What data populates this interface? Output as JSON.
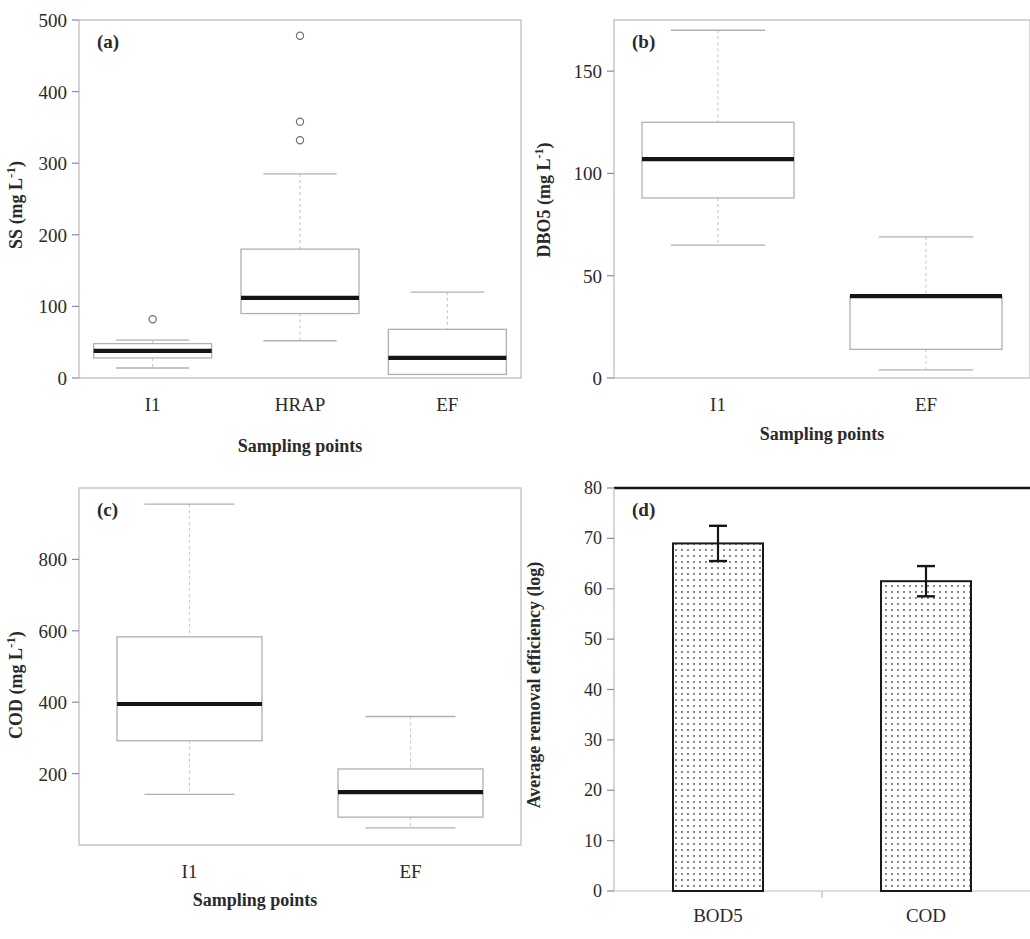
{
  "figure": {
    "panels": [
      "a",
      "b",
      "c",
      "d"
    ]
  },
  "chart_data": [
    {
      "type": "box",
      "panel_label": "(a)",
      "title": "",
      "xlabel": "Sampling points",
      "ylabel": "SS (mg L-1)",
      "ylabel_base": "SS (mg L",
      "ylabel_sup": "-1",
      "ylabel_tail": ")",
      "categories": [
        "I1",
        "HRAP",
        "EF"
      ],
      "ylim": [
        0,
        500
      ],
      "yticks": [
        0,
        100,
        200,
        300,
        400,
        500
      ],
      "ytick_labels": [
        "0",
        "100",
        "200",
        "300",
        "400",
        "500"
      ],
      "grid": false,
      "boxes": [
        {
          "category": "I1",
          "whisker_low": 14,
          "q1": 28,
          "median": 38,
          "q3": 48,
          "whisker_high": 53,
          "outliers": [
            82
          ]
        },
        {
          "category": "HRAP",
          "whisker_low": 52,
          "q1": 90,
          "median": 112,
          "q3": 180,
          "whisker_high": 285,
          "outliers": [
            478,
            358,
            332
          ]
        },
        {
          "category": "EF",
          "whisker_low": 5,
          "q1": 5,
          "median": 28,
          "q3": 68,
          "whisker_high": 120,
          "outliers": []
        }
      ]
    },
    {
      "type": "box",
      "panel_label": "(b)",
      "title": "",
      "xlabel": "Sampling points",
      "ylabel": "DBO5 (mg L-1)",
      "ylabel_base": "DBO5 (mg L",
      "ylabel_sup": "-1",
      "ylabel_tail": ")",
      "categories": [
        "I1",
        "EF"
      ],
      "ylim": [
        0,
        175
      ],
      "yticks": [
        0,
        50,
        100,
        150
      ],
      "ytick_labels": [
        "0",
        "50",
        "100",
        "150"
      ],
      "grid": false,
      "boxes": [
        {
          "category": "I1",
          "whisker_low": 65,
          "q1": 88,
          "median": 107,
          "q3": 125,
          "whisker_high": 170,
          "outliers": []
        },
        {
          "category": "EF",
          "whisker_low": 4,
          "q1": 14,
          "median": 40,
          "q3": 40,
          "whisker_high": 69,
          "outliers": []
        }
      ]
    },
    {
      "type": "box",
      "panel_label": "(c)",
      "title": "",
      "xlabel": "Sampling points",
      "ylabel": "COD (mg L-1)",
      "ylabel_base": "COD (mg L",
      "ylabel_sup": "-1",
      "ylabel_tail": ")",
      "categories": [
        "I1",
        "EF"
      ],
      "ylim": [
        0,
        1000
      ],
      "yticks": [
        200,
        400,
        600,
        800
      ],
      "ytick_labels": [
        "200",
        "400",
        "600",
        "800"
      ],
      "grid": false,
      "boxes": [
        {
          "category": "I1",
          "whisker_low": 142,
          "q1": 292,
          "median": 395,
          "q3": 583,
          "whisker_high": 955,
          "outliers": []
        },
        {
          "category": "EF",
          "whisker_low": 48,
          "q1": 78,
          "median": 148,
          "q3": 213,
          "whisker_high": 360,
          "outliers": []
        }
      ]
    },
    {
      "type": "bar",
      "panel_label": "(d)",
      "title": "",
      "xlabel": "Organic parameters",
      "ylabel": "Average removal efficiency (log)",
      "categories": [
        "BOD5",
        "COD"
      ],
      "values": [
        69,
        61.5
      ],
      "errors": [
        3.5,
        3.0
      ],
      "ylim": [
        0,
        80
      ],
      "yticks": [
        0,
        10,
        20,
        30,
        40,
        50,
        60,
        70,
        80
      ],
      "ytick_labels": [
        "0",
        "10",
        "20",
        "30",
        "40",
        "50",
        "60",
        "70",
        "80"
      ],
      "grid": false,
      "bar_fill": "dotted",
      "bar_edge_color": "#1a1a1a"
    }
  ]
}
